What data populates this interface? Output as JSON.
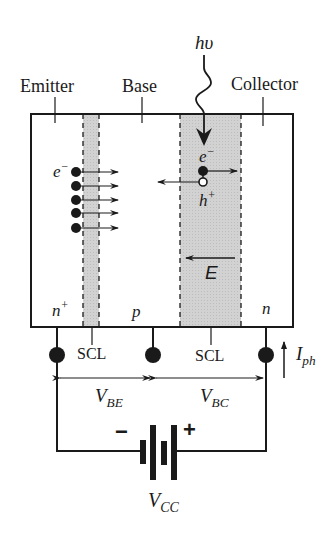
{
  "regions": {
    "emitter": "Emitter",
    "base": "Base",
    "collector": "Collector"
  },
  "doping": {
    "emitter": "n",
    "emitter_sup": "+",
    "base": "p",
    "collector": "n"
  },
  "photon": {
    "label_h": "h",
    "label_nu": "υ"
  },
  "carriers": {
    "electron_base": "e",
    "electron_sup": "−",
    "electron_scl": "e",
    "electron_scl_sup": "−",
    "hole": "h",
    "hole_sup": "+",
    "injected_electron_count": 5
  },
  "field": {
    "label": "E"
  },
  "scl": {
    "left": "SCL",
    "right": "SCL"
  },
  "voltages": {
    "vbe_main": "V",
    "vbe_sub": "BE",
    "vbc_main": "V",
    "vbc_sub": "BC",
    "vcc_main": "V",
    "vcc_sub": "CC"
  },
  "current": {
    "main": "I",
    "sub": "ph"
  },
  "battery": {
    "minus": "−",
    "plus": "+"
  },
  "colors": {
    "ink": "#1a1a1a",
    "scl_fill": "#cfcfcf",
    "background": "#ffffff"
  }
}
